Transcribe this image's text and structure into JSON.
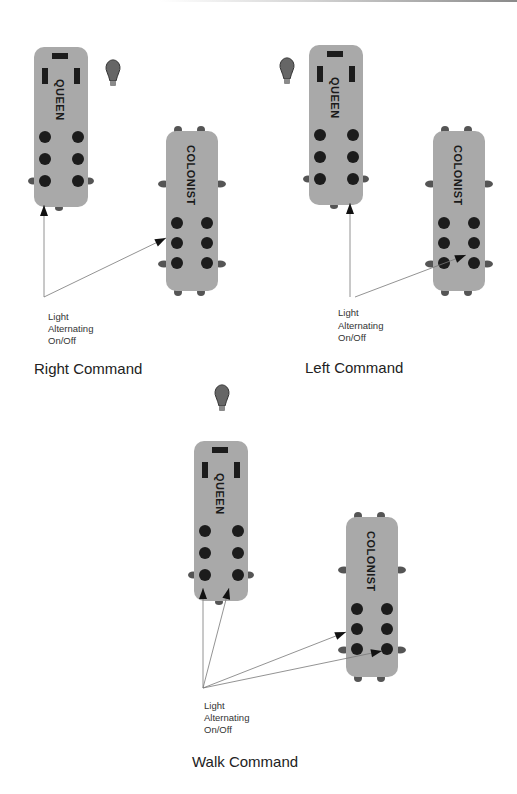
{
  "labels": {
    "queen": "QUEEN",
    "colonist": "COLONIST",
    "light_note": [
      "Light",
      "Alternating",
      "On/Off"
    ]
  },
  "panels": [
    {
      "id": "right",
      "caption": "Right Command",
      "bulb_side": "right-of-queen",
      "queen_blinking_wheels": [
        "rear-left"
      ],
      "colonist_blinking_wheels": [
        "middle-left"
      ]
    },
    {
      "id": "left",
      "caption": "Left Command",
      "bulb_side": "left-of-queen",
      "queen_blinking_wheels": [
        "rear-right"
      ],
      "colonist_blinking_wheels": [
        "rear-left"
      ]
    },
    {
      "id": "walk",
      "caption": "Walk Command",
      "bulb_side": "above-queen",
      "queen_blinking_wheels": [
        "rear-left",
        "rear-right"
      ],
      "colonist_blinking_wheels": [
        "middle-left",
        "rear-left"
      ]
    }
  ],
  "icons": {
    "bulb": "light-bulb-icon"
  },
  "colors": {
    "robot_body": "#a9a9a9",
    "wheel": "#1c1c1c",
    "arrow": "#777777"
  }
}
